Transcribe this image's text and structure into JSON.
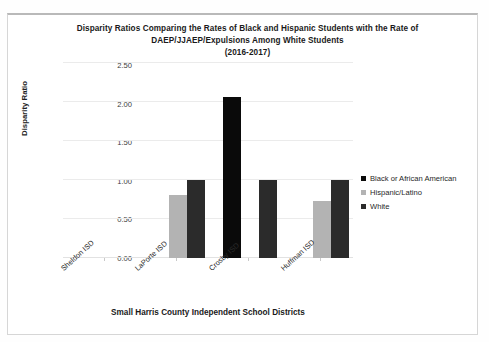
{
  "chart_data": {
    "type": "bar",
    "title": "Disparity Ratios Comparing the Rates of Black and Hispanic Students with the Rate of DAEP/JJAEP/Expulsions Among White Students (2016-2017)",
    "title_lines": [
      "Disparity Ratios Comparing the Rates of Black and Hispanic Students with the Rate of",
      "DAEP/JJAEP/Expulsions Among White Students",
      "(2016-2017)"
    ],
    "xlabel": "Small Harris County Independent School Districts",
    "ylabel": "Disparity Ratio",
    "categories": [
      "Sheldon ISD",
      "LaPorte ISD",
      "Crosby ISD",
      "Huffman ISD"
    ],
    "series": [
      {
        "name": "Black or African American",
        "color": "#0a0a0a",
        "values": [
          0,
          0,
          2.06,
          0
        ]
      },
      {
        "name": "Hispanic/Latino",
        "color": "#b3b3b3",
        "values": [
          0,
          0.81,
          0,
          0.73
        ]
      },
      {
        "name": "White",
        "color": "#2b2b2b",
        "values": [
          0,
          1.0,
          1.0,
          1.0
        ]
      }
    ],
    "ylim": [
      0,
      2.5
    ],
    "ytick_values": [
      2.5,
      2.0,
      1.5,
      1.0,
      0.5,
      0
    ],
    "ytick_labels": [
      "2.50",
      "2.00",
      "1.50",
      "1.00",
      "0.50",
      "0.00"
    ],
    "grid": true,
    "legend_position": "right"
  }
}
